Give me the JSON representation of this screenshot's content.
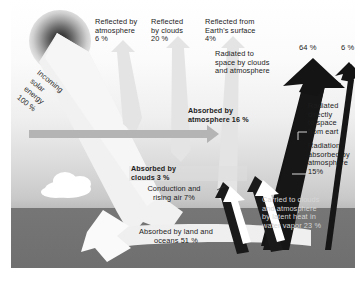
{
  "diagram": {
    "background": {
      "sky_top": "#ffffff",
      "sky_bottom": "#bdbdbd",
      "ground": "#767676"
    }
  },
  "sun": {
    "name": "sun"
  },
  "labels": {
    "reflected_atmosphere": "Reflected by\natmosphere\n6 %",
    "reflected_clouds": "Reflected\nby clouds\n20 %",
    "reflected_surface": "Reflected from\nEarth's surface\n4%",
    "radiated_space_clouds": "Radiated to\nspace by clouds\nand atmosphere",
    "incoming_solar": "Incoming\nsolar\nenergy\n100 %",
    "absorbed_atmosphere": "Absorbed by\natmosphere 16 %",
    "absorbed_clouds": "Absorbed by\nclouds 3 %",
    "conduction": "Conduction and\nrising air 7%",
    "absorbed_land": "Absorbed by land and\noceans 51 %",
    "radiated_directly": "Radiated\ndirectly\nto space\nfrom eart",
    "radiation_absorbed": "Radiation\nabsorbed by\natmosphere\n15%",
    "latent_heat": "Carried to clouds\nand atmosphere\nby latent heat in\nwater vapor 23 %",
    "pct_64": "64 %",
    "pct_6": "6 %"
  },
  "values": {
    "incoming_solar_energy": 100,
    "reflected_by_atmosphere": 6,
    "reflected_by_clouds": 20,
    "reflected_from_surface": 4,
    "absorbed_by_atmosphere": 16,
    "absorbed_by_clouds": 3,
    "absorbed_by_land_and_oceans": 51,
    "conduction_and_rising_air": 7,
    "latent_heat_water_vapor": 23,
    "radiation_absorbed_by_atmosphere": 15,
    "radiated_to_space_clouds_atmosphere": 64,
    "radiated_directly_to_space": 6
  },
  "colors": {
    "light_arrow": "#e2e2e2",
    "dark_arrow": "#1a1a1a",
    "white_arrow": "#ffffff",
    "mid_arrow": "#a8a8a8",
    "text": "#1c1c1c",
    "text_light": "#d6d6d6"
  }
}
